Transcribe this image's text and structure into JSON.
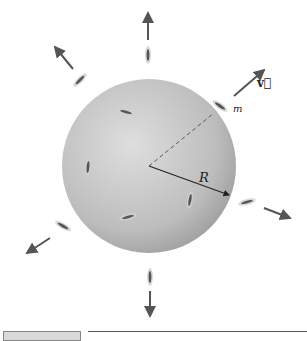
{
  "diagram": {
    "type": "physics-illustration",
    "sphere": {
      "cx": 149,
      "cy": 166,
      "r": 87,
      "fill_light": "#dcdcdc",
      "fill_dark": "#9e9e9e"
    },
    "labels": {
      "mass": "m",
      "velocity": "v⃗",
      "radius": "R"
    },
    "arrow_color": "#555555",
    "molecules_outside": [
      {
        "x": 148,
        "y": 55,
        "angle": 90,
        "arrow": {
          "x1": 148,
          "y1": 40,
          "x2": 148,
          "y2": 13
        }
      },
      {
        "x": 80,
        "y": 80,
        "angle": 45,
        "arrow": {
          "x1": 73,
          "y1": 69,
          "x2": 55,
          "y2": 47
        }
      },
      {
        "x": 220,
        "y": 106,
        "angle": -35,
        "arrow": {
          "x1": 234,
          "y1": 96,
          "x2": 264,
          "y2": 70
        }
      },
      {
        "x": 247,
        "y": 202,
        "angle": 15,
        "arrow": {
          "x1": 264,
          "y1": 208,
          "x2": 290,
          "y2": 218
        }
      },
      {
        "x": 63,
        "y": 226,
        "angle": -30,
        "arrow": {
          "x1": 50,
          "y1": 238,
          "x2": 27,
          "y2": 253
        }
      },
      {
        "x": 150,
        "y": 277,
        "angle": 90,
        "arrow": {
          "x1": 150,
          "y1": 291,
          "x2": 150,
          "y2": 316
        }
      }
    ],
    "molecules_inside": [
      {
        "x": 126,
        "y": 112,
        "angle": -15
      },
      {
        "x": 88,
        "y": 167,
        "angle": 85
      },
      {
        "x": 190,
        "y": 200,
        "angle": 80
      },
      {
        "x": 128,
        "y": 217,
        "angle": 15
      }
    ],
    "footer": {
      "box_label": "",
      "rule": true
    }
  }
}
